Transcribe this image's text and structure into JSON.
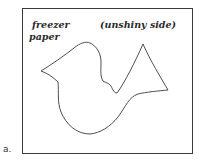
{
  "figure": {
    "label": "a.",
    "paper_label_line1": "freezer",
    "paper_label_line2": "paper",
    "side_label": "(unshiny side)",
    "shape": "bird-template-outline",
    "colors": {
      "line": "#3a3a3a",
      "background": "#ffffff"
    }
  }
}
